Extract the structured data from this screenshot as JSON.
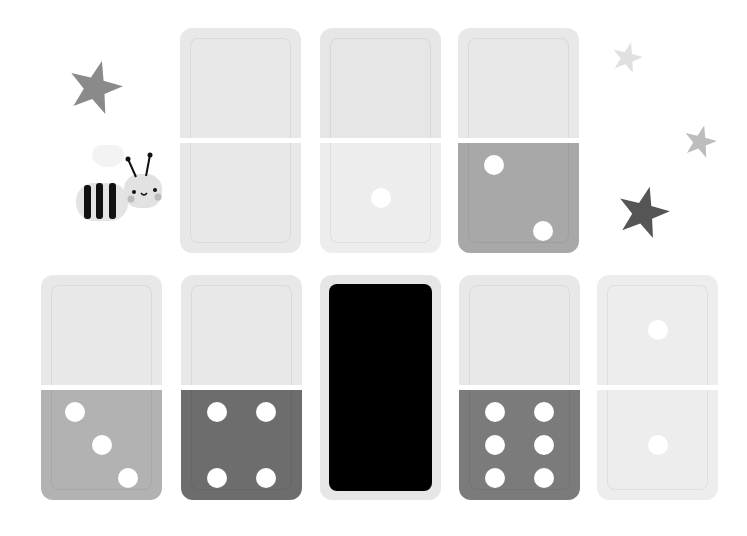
{
  "scene": {
    "title": "Domino matching game",
    "background": "#ffffff"
  },
  "decorations": {
    "stars": [
      {
        "name": "star-gray-left",
        "x": 95,
        "y": 88,
        "size": 28,
        "color": "#8a8a8a"
      },
      {
        "name": "star-faint-right-top",
        "x": 627,
        "y": 58,
        "size": 16,
        "color": "#e0e0e0"
      },
      {
        "name": "star-light-right",
        "x": 700,
        "y": 142,
        "size": 17,
        "color": "#bdbdbd"
      },
      {
        "name": "star-dark-right",
        "x": 643,
        "y": 213,
        "size": 27,
        "color": "#555555"
      }
    ],
    "bee": {
      "label": "bee mascot"
    }
  },
  "dominoes": [
    {
      "id": "d1",
      "row": 1,
      "x": 180,
      "y": 28,
      "top_pips": 0,
      "bottom_pips": 0,
      "top_color": "#e8e8e8",
      "bottom_color": "#e8e8e8",
      "face_down": false
    },
    {
      "id": "d2",
      "row": 1,
      "x": 320,
      "y": 28,
      "top_pips": 0,
      "bottom_pips": 1,
      "top_color": "#e6e6e6",
      "bottom_color": "#ededed",
      "face_down": false
    },
    {
      "id": "d3",
      "row": 1,
      "x": 458,
      "y": 28,
      "top_pips": 0,
      "bottom_pips": 2,
      "top_color": "#e8e8e8",
      "bottom_color": "#a8a8a8",
      "face_down": false
    },
    {
      "id": "d4",
      "row": 2,
      "x": 41,
      "y": 275,
      "top_pips": 0,
      "bottom_pips": 3,
      "top_color": "#e8e8e8",
      "bottom_color": "#b2b2b2",
      "face_down": false
    },
    {
      "id": "d5",
      "row": 2,
      "x": 181,
      "y": 275,
      "top_pips": 0,
      "bottom_pips": 4,
      "top_color": "#e8e8e8",
      "bottom_color": "#6d6d6d",
      "face_down": false
    },
    {
      "id": "d6",
      "row": 2,
      "x": 320,
      "y": 275,
      "top_pips": null,
      "bottom_pips": null,
      "top_color": "#e6e6e6",
      "bottom_color": "#e6e6e6",
      "face_down": true,
      "face_color": "#000000"
    },
    {
      "id": "d7",
      "row": 2,
      "x": 459,
      "y": 275,
      "top_pips": 0,
      "bottom_pips": 6,
      "top_color": "#e8e8e8",
      "bottom_color": "#7b7b7b",
      "face_down": false
    },
    {
      "id": "d8",
      "row": 2,
      "x": 597,
      "y": 275,
      "top_pips": 1,
      "bottom_pips": 1,
      "top_color": "#ededed",
      "bottom_color": "#ededed",
      "face_down": false
    }
  ],
  "pip_color": "#ffffff"
}
